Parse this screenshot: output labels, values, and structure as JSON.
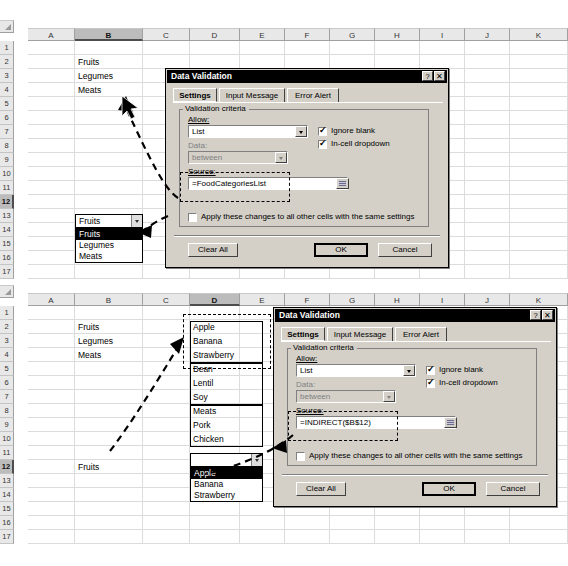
{
  "app": {
    "name": "Microsoft Excel - Data Validation dialog",
    "column_headers": [
      "A",
      "B",
      "C",
      "D",
      "E",
      "F",
      "G",
      "H",
      "I",
      "J",
      "K"
    ],
    "row_numbers": [
      "1",
      "2",
      "3",
      "4",
      "5",
      "6",
      "7",
      "8",
      "9",
      "10",
      "11",
      "12",
      "13",
      "14",
      "15",
      "16",
      "17"
    ]
  },
  "panel_top": {
    "selected_column": "B",
    "selected_row": "12",
    "cells": [
      {
        "ref": "B2",
        "value": "Fruits"
      },
      {
        "ref": "B3",
        "value": "Legumes"
      },
      {
        "ref": "B4",
        "value": "Meats"
      }
    ],
    "dropdown": {
      "cell": "B12",
      "value": "Fruits",
      "options": [
        "Fruits",
        "Legumes",
        "Meats"
      ],
      "highlighted": "Fruits"
    },
    "dialog": {
      "title": "Data Validation",
      "help_button": "?",
      "close_button": "✕",
      "tabs": [
        {
          "label": "Settings",
          "active": true
        },
        {
          "label": "Input Message",
          "active": false
        },
        {
          "label": "Error Alert",
          "active": false
        }
      ],
      "group_label": "Validation criteria",
      "allow_label": "Allow:",
      "allow_value": "List",
      "data_label": "Data:",
      "data_value": "between",
      "source_label": "Source:",
      "source_value": "=FoodCategoriesList",
      "ignore_blank_label": "Ignore blank",
      "ignore_blank_checked": true,
      "in_cell_dropdown_label": "In-cell dropdown",
      "in_cell_dropdown_checked": true,
      "apply_all_label": "Apply these changes to all other cells with the same settings",
      "apply_all_checked": false,
      "clear_all_label": "Clear All",
      "ok_label": "OK",
      "cancel_label": "Cancel"
    }
  },
  "panel_bottom": {
    "selected_column": "D",
    "selected_row": "12",
    "cells": [
      {
        "ref": "B2",
        "value": "Fruits"
      },
      {
        "ref": "B3",
        "value": "Legumes"
      },
      {
        "ref": "B4",
        "value": "Meats"
      },
      {
        "ref": "B12",
        "value": "Fruits"
      },
      {
        "ref": "D2",
        "value": "Apple"
      },
      {
        "ref": "D3",
        "value": "Banana"
      },
      {
        "ref": "D4",
        "value": "Strawberry"
      },
      {
        "ref": "D5",
        "value": "Bean"
      },
      {
        "ref": "D6",
        "value": "Lentil"
      },
      {
        "ref": "D7",
        "value": "Soy"
      },
      {
        "ref": "D8",
        "value": "Meats"
      },
      {
        "ref": "D9",
        "value": "Pork"
      },
      {
        "ref": "D10",
        "value": "Chicken"
      }
    ],
    "dropdown": {
      "cell": "D12",
      "value": "",
      "options": [
        "Apple",
        "Banana",
        "Strawberry"
      ],
      "highlighted": "Apple"
    },
    "dialog": {
      "title": "Data Validation",
      "help_button": "?",
      "close_button": "✕",
      "tabs": [
        {
          "label": "Settings",
          "active": true
        },
        {
          "label": "Input Message",
          "active": false
        },
        {
          "label": "Error Alert",
          "active": false
        }
      ],
      "group_label": "Validation criteria",
      "allow_label": "Allow:",
      "allow_value": "List",
      "data_label": "Data:",
      "data_value": "between",
      "source_label": "Source:",
      "source_value": "=INDIRECT($B$12)",
      "ignore_blank_label": "Ignore blank",
      "ignore_blank_checked": true,
      "in_cell_dropdown_label": "In-cell dropdown",
      "in_cell_dropdown_checked": true,
      "apply_all_label": "Apply these changes to all other cells with the same settings",
      "apply_all_checked": false,
      "clear_all_label": "Clear All",
      "ok_label": "OK",
      "cancel_label": "Cancel"
    }
  },
  "colors": {
    "dialog_face": "#d4d0c8",
    "titlebar": "#000000",
    "grid_line": "#dcdcdc",
    "header_face": "#e8e8e8",
    "header_selected": "#bcbcbc",
    "highlight": "#000000"
  }
}
